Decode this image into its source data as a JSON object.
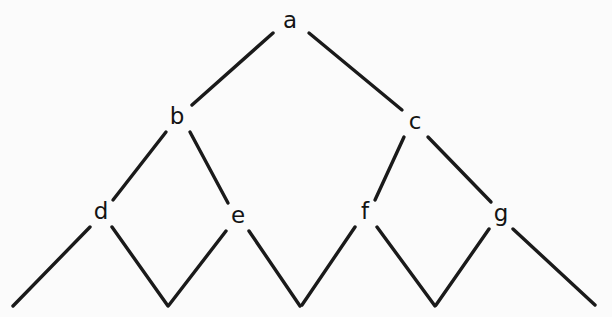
{
  "figure": {
    "kind": "binary-tree-diagram",
    "background_color": "#fbfbfb",
    "stroke_color": "#1a1a1a",
    "label_color": "#141414",
    "stroke_width": 3.4,
    "width": 612,
    "height": 317
  },
  "nodes": [
    {
      "id": "a",
      "label": "a",
      "x": 290,
      "y": 22,
      "level": 0
    },
    {
      "id": "b",
      "label": "b",
      "x": 177,
      "y": 118,
      "level": 1
    },
    {
      "id": "c",
      "label": "c",
      "x": 415,
      "y": 123,
      "level": 1
    },
    {
      "id": "d",
      "label": "d",
      "x": 101,
      "y": 213,
      "level": 2
    },
    {
      "id": "e",
      "label": "e",
      "x": 238,
      "y": 217,
      "level": 2
    },
    {
      "id": "f",
      "label": "f",
      "x": 365,
      "y": 213,
      "level": 2
    },
    {
      "id": "g",
      "label": "g",
      "x": 501,
      "y": 215,
      "level": 2
    }
  ],
  "edges": [
    {
      "id": "a-b",
      "from": "a",
      "to": "b",
      "x1": 273,
      "y1": 33,
      "x2": 192,
      "y2": 105
    },
    {
      "id": "a-c",
      "from": "a",
      "to": "c",
      "x1": 309,
      "y1": 33,
      "x2": 402,
      "y2": 110
    },
    {
      "id": "b-d",
      "from": "b",
      "to": "d",
      "x1": 166,
      "y1": 132,
      "x2": 113,
      "y2": 200
    },
    {
      "id": "b-e",
      "from": "b",
      "to": "e",
      "x1": 190,
      "y1": 132,
      "x2": 228,
      "y2": 203
    },
    {
      "id": "c-f",
      "from": "c",
      "to": "f",
      "x1": 404,
      "y1": 137,
      "x2": 375,
      "y2": 200
    },
    {
      "id": "c-g",
      "from": "c",
      "to": "g",
      "x1": 428,
      "y1": 137,
      "x2": 491,
      "y2": 202
    },
    {
      "id": "d-leaf-left",
      "from": "d",
      "to": "leaf-1",
      "x1": 90,
      "y1": 227,
      "x2": 13,
      "y2": 306
    },
    {
      "id": "d-leaf-right",
      "from": "d",
      "to": "leaf-2",
      "x1": 112,
      "y1": 227,
      "x2": 168,
      "y2": 306
    },
    {
      "id": "e-leaf-left",
      "from": "e",
      "to": "leaf-2",
      "x1": 226,
      "y1": 231,
      "x2": 169,
      "y2": 305
    },
    {
      "id": "e-leaf-right",
      "from": "e",
      "to": "leaf-3",
      "x1": 249,
      "y1": 231,
      "x2": 300,
      "y2": 306
    },
    {
      "id": "f-leaf-left",
      "from": "f",
      "to": "leaf-3",
      "x1": 355,
      "y1": 227,
      "x2": 302,
      "y2": 305
    },
    {
      "id": "f-leaf-right",
      "from": "f",
      "to": "leaf-4",
      "x1": 377,
      "y1": 227,
      "x2": 435,
      "y2": 306
    },
    {
      "id": "g-leaf-left",
      "from": "g",
      "to": "leaf-4",
      "x1": 489,
      "y1": 229,
      "x2": 436,
      "y2": 305
    },
    {
      "id": "g-leaf-right",
      "from": "g",
      "to": "leaf-5",
      "x1": 513,
      "y1": 229,
      "x2": 595,
      "y2": 305
    }
  ],
  "leaf_vertices": [
    {
      "id": "leaf-1",
      "x": 13,
      "y": 306,
      "open": true
    },
    {
      "id": "leaf-2",
      "x": 168,
      "y": 306,
      "open": false
    },
    {
      "id": "leaf-3",
      "x": 301,
      "y": 306,
      "open": false
    },
    {
      "id": "leaf-4",
      "x": 435,
      "y": 306,
      "open": false
    },
    {
      "id": "leaf-5",
      "x": 595,
      "y": 305,
      "open": true
    }
  ]
}
